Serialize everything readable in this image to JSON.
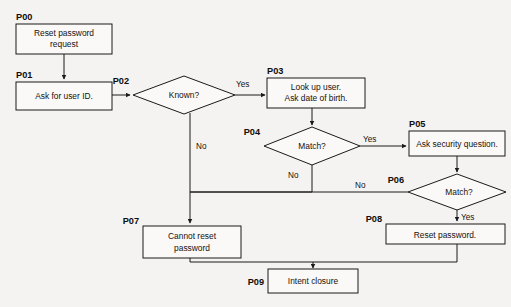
{
  "diagram": {
    "background_color": "#f4f3f1",
    "line_color": "#1a1a1a",
    "shape_fill": "#faf9f7"
  },
  "nodes": [
    {
      "id": "P00",
      "label": "P00",
      "shape": "process",
      "lines": [
        "Reset password",
        "request"
      ]
    },
    {
      "id": "P01",
      "label": "P01",
      "shape": "process",
      "lines": [
        "Ask for user ID."
      ]
    },
    {
      "id": "P02",
      "label": "P02",
      "shape": "decision",
      "lines": [
        "Known?"
      ]
    },
    {
      "id": "P03",
      "label": "P03",
      "shape": "process",
      "lines": [
        "Look up user.",
        "Ask date of birth."
      ]
    },
    {
      "id": "P04",
      "label": "P04",
      "shape": "decision",
      "lines": [
        "Match?"
      ]
    },
    {
      "id": "P05",
      "label": "P05",
      "shape": "process",
      "lines": [
        "Ask security question."
      ]
    },
    {
      "id": "P06",
      "label": "P06",
      "shape": "decision",
      "lines": [
        "Match?"
      ]
    },
    {
      "id": "P07",
      "label": "P07",
      "shape": "process",
      "lines": [
        "Cannot reset",
        "password"
      ]
    },
    {
      "id": "P08",
      "label": "P08",
      "shape": "process",
      "lines": [
        "Reset password."
      ]
    },
    {
      "id": "P09",
      "label": "P09",
      "shape": "process",
      "lines": [
        "Intent closure"
      ]
    }
  ],
  "edge_labels": {
    "p02_yes": "Yes",
    "p02_no": "No",
    "p04_yes": "Yes",
    "p04_no": "No",
    "p06_yes": "Yes",
    "p06_no": "No"
  },
  "edges": [
    {
      "from": "P00",
      "to": "P01",
      "label": ""
    },
    {
      "from": "P01",
      "to": "P02",
      "label": ""
    },
    {
      "from": "P02",
      "to": "P03",
      "label": "Yes"
    },
    {
      "from": "P02",
      "to": "P07",
      "label": "No"
    },
    {
      "from": "P03",
      "to": "P04",
      "label": ""
    },
    {
      "from": "P04",
      "to": "P05",
      "label": "Yes"
    },
    {
      "from": "P04",
      "to": "P07",
      "label": "No"
    },
    {
      "from": "P05",
      "to": "P06",
      "label": ""
    },
    {
      "from": "P06",
      "to": "P08",
      "label": "Yes"
    },
    {
      "from": "P06",
      "to": "P07",
      "label": "No"
    },
    {
      "from": "P07",
      "to": "P09",
      "label": ""
    },
    {
      "from": "P08",
      "to": "P09",
      "label": ""
    }
  ]
}
